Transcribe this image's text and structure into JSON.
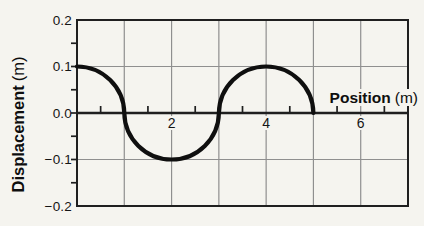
{
  "chart_data": {
    "type": "line",
    "title": "",
    "xlabel": {
      "bold": "Position",
      "unit": "(m)"
    },
    "ylabel": {
      "bold": "Displacement",
      "unit": "(m)"
    },
    "xlim": [
      0,
      7
    ],
    "ylim": [
      -0.2,
      0.2
    ],
    "grid": true,
    "x_gridlines": [
      1,
      2,
      3,
      4,
      5,
      6
    ],
    "y_gridlines": [
      0.1,
      -0.1
    ],
    "x_minor_ticks": [
      0.5,
      1.5,
      2.5,
      3.5,
      4.5,
      5.5,
      6.5
    ],
    "y_minor_ticks": [
      0.15,
      0.1,
      0.05,
      0,
      -0.05,
      -0.1,
      -0.15
    ],
    "x_tick_labels": [
      {
        "value": 2,
        "label": "2"
      },
      {
        "value": 4,
        "label": "4"
      },
      {
        "value": 6,
        "label": "6"
      }
    ],
    "y_tick_labels": [
      {
        "value": 0.2,
        "label": "0.2"
      },
      {
        "value": 0.1,
        "label": "0.1"
      },
      {
        "value": 0,
        "label": "0.0"
      },
      {
        "value": -0.1,
        "label": "−0.1"
      },
      {
        "value": -0.2,
        "label": "−0.2"
      }
    ],
    "series": [
      {
        "name": "wave",
        "amplitude": 0.1,
        "wavelength": 4,
        "x_start": 0,
        "x_end": 5,
        "points": [
          [
            0,
            0.1
          ],
          [
            1,
            0
          ],
          [
            2,
            -0.1
          ],
          [
            3,
            0
          ],
          [
            4,
            0.1
          ],
          [
            5,
            0
          ]
        ]
      }
    ],
    "colors": {
      "curve": "#0f0f0f",
      "grid": "#8f8f8f",
      "axis": "#1f1f1f",
      "background": "#f5f4ef",
      "text": "#111111"
    }
  }
}
